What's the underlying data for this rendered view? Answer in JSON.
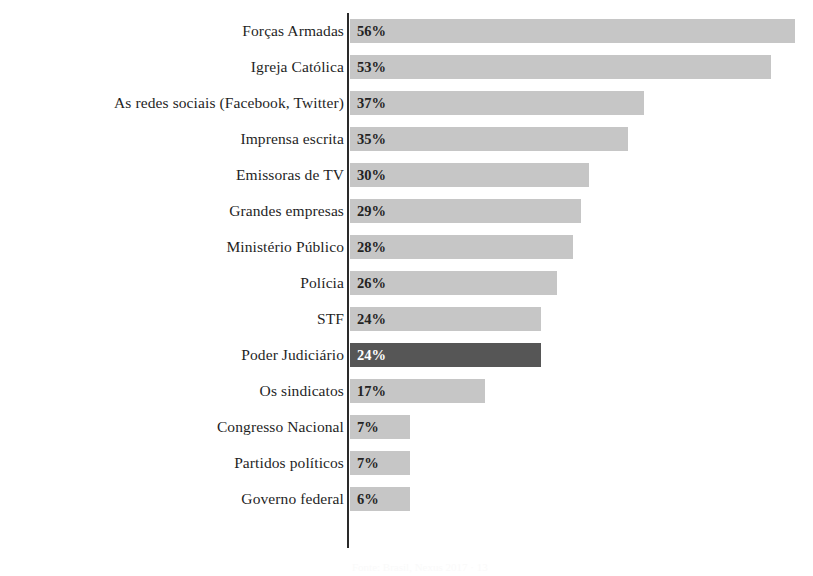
{
  "chart_data": {
    "type": "bar",
    "orientation": "horizontal",
    "title": "",
    "subtitle": "",
    "xlabel": "",
    "ylabel": "",
    "xlim": [
      0,
      60
    ],
    "grid": false,
    "legend": null,
    "value_suffix": "%",
    "categories": [
      "Forças Armadas",
      "Igreja Católica",
      "As redes sociais (Facebook, Twitter)",
      "Imprensa escrita",
      "Emissoras de TV",
      "Grandes empresas",
      "Ministério Público",
      "Polícia",
      "STF",
      "Poder Judiciário",
      "Os sindicatos",
      "Congresso Nacional",
      "Partidos políticos",
      "Governo federal"
    ],
    "values": [
      56,
      53,
      37,
      35,
      30,
      29,
      28,
      26,
      24,
      24,
      17,
      7,
      7,
      6
    ],
    "value_labels": [
      "56%",
      "53%",
      "37%",
      "35%",
      "30%",
      "29%",
      "28%",
      "26%",
      "24%",
      "24%",
      "17%",
      "7%",
      "7%",
      "6%"
    ],
    "highlighted_index": 9,
    "highlighted_category": "Poder Judiciário",
    "colors": {
      "bar": "#c6c6c6",
      "bar_highlight": "#565656",
      "value_text": "#232323",
      "value_text_highlight": "#ffffff",
      "axis_line": "#2a2a2a",
      "category_text": "#1f1f1f",
      "background": "#ffffff"
    }
  },
  "caption": {
    "text": "Fonte: Brasil, Nexus 2017 · 13"
  }
}
